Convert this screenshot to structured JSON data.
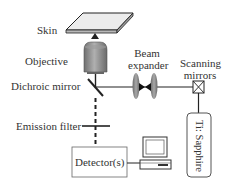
{
  "diagram": {
    "labels": {
      "skin": "Skin",
      "objective": "Objective",
      "dichroic_mirror": "Dichroic mirror",
      "emission_filter": "Emission filter",
      "beam_expander_line1": "Beam",
      "beam_expander_line2": "expander",
      "scanning_mirrors_line1": "Scanning",
      "scanning_mirrors_line2": "mirrors",
      "laser": "Ti: Sapphire",
      "detector": "Detector(s)"
    },
    "colors": {
      "line": "#222222",
      "objective_fill": "#8a8a8a",
      "lens_fill": "#7f7f7f",
      "skin_fill": "#b8b8b8",
      "text": "#333333"
    },
    "nodes": [
      "Skin",
      "Objective",
      "Dichroic mirror",
      "Emission filter",
      "Detector(s)",
      "Computer",
      "Beam expander",
      "Scanning mirrors",
      "Ti: Sapphire"
    ],
    "edges": [
      {
        "from": "Ti: Sapphire",
        "to": "Scanning mirrors"
      },
      {
        "from": "Scanning mirrors",
        "to": "Beam expander"
      },
      {
        "from": "Beam expander",
        "to": "Dichroic mirror"
      },
      {
        "from": "Dichroic mirror",
        "to": "Objective"
      },
      {
        "from": "Objective",
        "to": "Skin"
      },
      {
        "from": "Dichroic mirror",
        "to": "Emission filter",
        "style": "dashed"
      },
      {
        "from": "Emission filter",
        "to": "Detector(s)",
        "style": "dashed"
      },
      {
        "from": "Detector(s)",
        "to": "Computer"
      }
    ]
  }
}
